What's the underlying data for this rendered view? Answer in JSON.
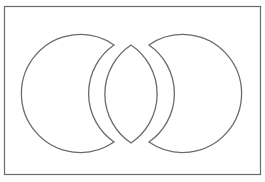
{
  "diagram": {
    "type": "exploded-venn",
    "stroke_color": "#6b6b6b",
    "fill_color": "#ffffff",
    "frame": {
      "x": 4.5,
      "y": 6.5,
      "width": 256,
      "height": 168
    },
    "regions": [
      {
        "id": "left-crescent",
        "label": "",
        "path": "M 114 45 A 59 59 0 1 0 114 142 A 59 59 0 0 1 114 45 Z"
      },
      {
        "id": "center-lens",
        "label": "",
        "path": "M 131 45 A 59 59 0 0 0 131 143 A 59 59 0 0 0 131 45 Z"
      },
      {
        "id": "right-crescent",
        "label": "",
        "path": "M 149 45 A 59 59 0 1 1 149 142 A 59 59 0 0 0 149 45 Z"
      }
    ]
  }
}
